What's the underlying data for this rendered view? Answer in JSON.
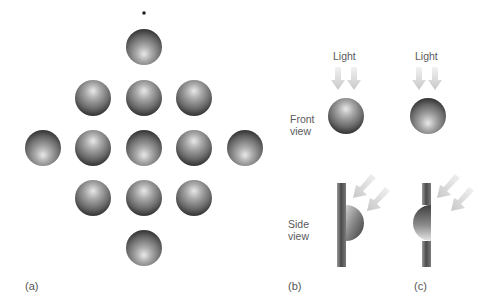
{
  "figure": {
    "panels": {
      "a": {
        "label": "(a)",
        "fixation_dot": {
          "x": 144,
          "y": 13
        },
        "sphere_radius": 18,
        "spheres": [
          {
            "x": 144,
            "y": 47,
            "lit_from": "bottom"
          },
          {
            "x": 93,
            "y": 98,
            "lit_from": "top"
          },
          {
            "x": 144,
            "y": 98,
            "lit_from": "top"
          },
          {
            "x": 194,
            "y": 98,
            "lit_from": "top"
          },
          {
            "x": 43,
            "y": 148,
            "lit_from": "bottom"
          },
          {
            "x": 93,
            "y": 148,
            "lit_from": "top"
          },
          {
            "x": 144,
            "y": 148,
            "lit_from": "bottom"
          },
          {
            "x": 194,
            "y": 148,
            "lit_from": "top"
          },
          {
            "x": 245,
            "y": 148,
            "lit_from": "bottom"
          },
          {
            "x": 93,
            "y": 198,
            "lit_from": "top"
          },
          {
            "x": 144,
            "y": 198,
            "lit_from": "top"
          },
          {
            "x": 194,
            "y": 198,
            "lit_from": "top"
          },
          {
            "x": 144,
            "y": 248,
            "lit_from": "bottom"
          }
        ]
      },
      "b": {
        "label": "(b)",
        "light_label": "Light",
        "front_view_label": "Front\nview",
        "side_view_label": "Side\nview",
        "front_sphere": "convex bump lit from top",
        "side_shape": "hemisphere protruding from wall"
      },
      "c": {
        "label": "(c)",
        "light_label": "Light",
        "front_sphere": "concave dent lit from top (appears shaded at top)",
        "side_shape": "hemispherical cavity in wall"
      }
    },
    "colors": {
      "background": "#ffffff",
      "sphere_highlight": "#e6e6e6",
      "sphere_mid": "#8a8a8a",
      "sphere_shadow": "#3e3e3e",
      "arrow": "#cfcfcf",
      "wall_dark": "#4a4a4a",
      "text": "#5a5a5a"
    }
  }
}
